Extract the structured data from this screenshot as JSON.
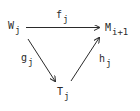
{
  "diagram": {
    "type": "commutative-diagram",
    "nodes": [
      {
        "id": "W",
        "base": "W",
        "sub": "j"
      },
      {
        "id": "M",
        "base": "M",
        "sub": "i+1"
      },
      {
        "id": "T",
        "base": "T",
        "sub": "j"
      }
    ],
    "edges": [
      {
        "from": "W",
        "to": "M",
        "label_base": "f",
        "label_sub": "j"
      },
      {
        "from": "W",
        "to": "T",
        "label_base": "g",
        "label_sub": "j"
      },
      {
        "from": "T",
        "to": "M",
        "label_base": "h",
        "label_sub": "j"
      }
    ],
    "colors": {
      "ink": "#2a2a2a",
      "background": "#ffffff"
    }
  }
}
